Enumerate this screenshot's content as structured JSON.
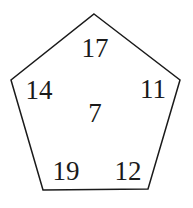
{
  "diagram": {
    "shape": "pentagon",
    "stroke_color": "#1a1a1a",
    "vertices": [
      [
        94,
        14
      ],
      [
        180,
        80
      ],
      [
        148,
        189
      ],
      [
        43,
        190
      ],
      [
        11,
        80
      ]
    ],
    "numbers": {
      "top": "17",
      "left": "14",
      "right": "11",
      "center": "7",
      "bottom_left": "19",
      "bottom_right": "12"
    }
  }
}
